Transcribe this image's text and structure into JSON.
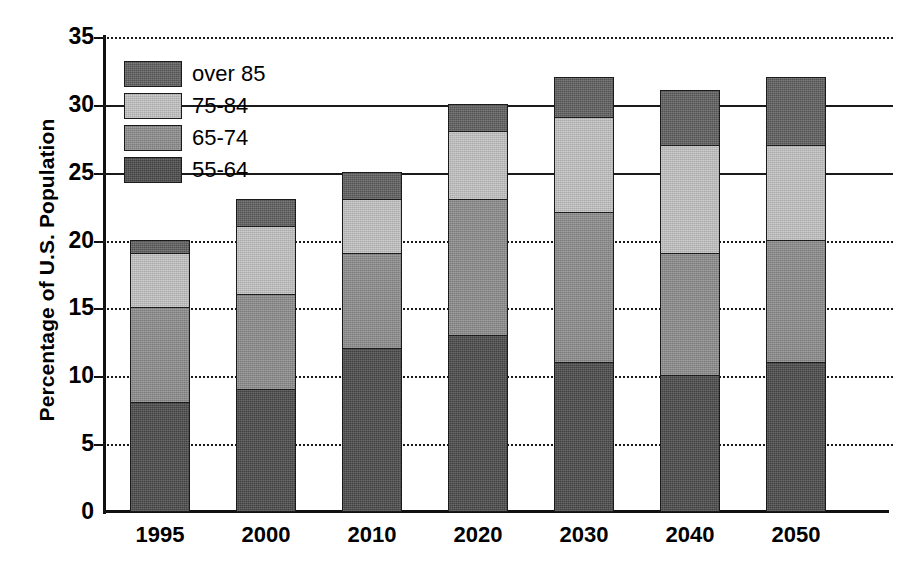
{
  "chart_data": {
    "type": "bar",
    "subtype": "stacked-bar",
    "title": "",
    "xlabel": "",
    "ylabel": "Percentage of U.S. Population",
    "categories": [
      "1995",
      "2000",
      "2010",
      "2020",
      "2030",
      "2040",
      "2050"
    ],
    "series": [
      {
        "name": "55-64",
        "values": [
          8,
          9,
          12,
          13,
          11,
          10,
          11
        ],
        "color": "#4a4a4a"
      },
      {
        "name": "65-74",
        "values": [
          7,
          7,
          7,
          10,
          11,
          9,
          9
        ],
        "color": "#8c8c8c"
      },
      {
        "name": "75-84",
        "values": [
          4,
          5,
          4,
          5,
          7,
          8,
          7
        ],
        "color": "#c2c2c2"
      },
      {
        "name": "over 85",
        "values": [
          1,
          2,
          2,
          2,
          3,
          4,
          5
        ],
        "color": "#5e5e5e"
      }
    ],
    "stack_order_bottom_to_top": [
      "55-64",
      "65-74",
      "75-84",
      "over 85"
    ],
    "totals": [
      20,
      23,
      25,
      30,
      32,
      31,
      32
    ],
    "ylim": [
      0,
      35
    ],
    "yticks": [
      0,
      5,
      10,
      15,
      20,
      25,
      30,
      35
    ],
    "ytick_labels": [
      "0",
      "5",
      "10",
      "15",
      "20",
      "25",
      "30",
      "35"
    ],
    "grid": true,
    "grid_axis": "y",
    "grid_style": "dotted",
    "legend_position": "upper-left-inside",
    "legend_order_top_to_bottom": [
      "over 85",
      "75-84",
      "65-74",
      "55-64"
    ]
  },
  "axes": {
    "y_title": "Percentage of U.S. Population"
  },
  "legend": {
    "entries": [
      {
        "label": "over 85",
        "color": "#5e5e5e"
      },
      {
        "label": "75-84",
        "color": "#c2c2c2"
      },
      {
        "label": "65-74",
        "color": "#8c8c8c"
      },
      {
        "label": "55-64",
        "color": "#4a4a4a"
      }
    ]
  },
  "colors": {
    "background": "#ffffff",
    "foreground": "#111111",
    "grid": "#1a1a1a",
    "series_55_64": "#4a4a4a",
    "series_65_74": "#8c8c8c",
    "series_75_84": "#c2c2c2",
    "series_over_85": "#5e5e5e"
  }
}
